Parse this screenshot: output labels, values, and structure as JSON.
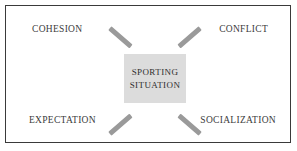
{
  "diagram": {
    "center": {
      "lines": [
        "SPORTING",
        "SITUATION"
      ],
      "fill_color": "#dcdcdc",
      "text_color": "#2e2e2e"
    },
    "corners": [
      {
        "id": "cohesion",
        "label": "COHESION",
        "position": "top-left"
      },
      {
        "id": "conflict",
        "label": "CONFLICT",
        "position": "top-right"
      },
      {
        "id": "expectation",
        "label": "EXPECTATION",
        "position": "bottom-left"
      },
      {
        "id": "socialization",
        "label": "SOCIALIZATION",
        "position": "bottom-right"
      }
    ],
    "connector_color": "#9a9a9a",
    "frame": {
      "border_color": "#3a3a3a",
      "background_color": "#ffffff"
    }
  }
}
